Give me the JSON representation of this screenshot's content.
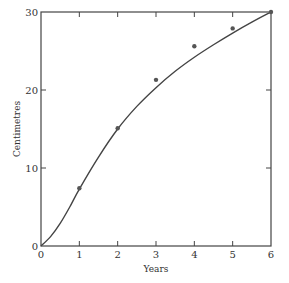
{
  "chart_data": {
    "type": "scatter",
    "title": "",
    "xlabel": "Years",
    "ylabel": "Centimetres",
    "xlim": [
      0,
      6
    ],
    "ylim": [
      0,
      30
    ],
    "xticks": [
      0,
      1,
      2,
      3,
      4,
      5,
      6
    ],
    "yticks": [
      0,
      10,
      20,
      30
    ],
    "grid": false,
    "series": [
      {
        "name": "observed",
        "kind": "points",
        "x": [
          1,
          2,
          3,
          4,
          5,
          6
        ],
        "y": [
          7.4,
          15.1,
          21.3,
          25.6,
          27.9,
          30.0
        ]
      },
      {
        "name": "fitted curve",
        "kind": "line",
        "x": [
          0,
          0.25,
          0.5,
          0.75,
          1,
          1.5,
          2,
          2.5,
          3,
          3.5,
          4,
          4.5,
          5,
          5.5,
          6
        ],
        "y": [
          0,
          1.2,
          2.9,
          5.0,
          7.3,
          11.4,
          15.0,
          17.9,
          20.3,
          22.4,
          24.2,
          25.8,
          27.3,
          28.7,
          30.0
        ]
      }
    ]
  }
}
